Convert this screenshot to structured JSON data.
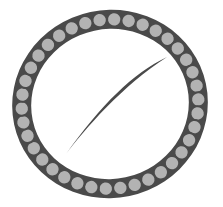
{
  "canvas": {
    "width": 223,
    "height": 207,
    "background": "#ffffff",
    "title": "Beaded Oval Emblem with Swash Stroke"
  },
  "colors": {
    "background": "#ffffff",
    "ring_dark": "#4a4a4a",
    "bead_fill": "#b3b3b3",
    "bead_outline": "#4a4a4a",
    "swash_fill": "#4a4a4a"
  },
  "ring": {
    "label": "beaded-oval-ring",
    "center_x": 110,
    "center_y": 104,
    "outer_rx": 98,
    "outer_ry": 94,
    "inner_rx": 79,
    "inner_ry": 75,
    "rotation_deg": -12,
    "band_thickness": 19,
    "bead_count": 38,
    "bead_radius": 7.2,
    "bead_ring_rx": 88.5,
    "bead_ring_ry": 84.5,
    "bead_outline_width": 2.0
  },
  "swash": {
    "label": "swash-stroke",
    "description": "stylized leaf flame stroke",
    "tip_top_x": 167,
    "tip_top_y": 57,
    "tip_bottom_x": 62,
    "tip_bottom_y": 156,
    "fill": "#4a4a4a"
  },
  "meta": {
    "element_name": "emblem-logo",
    "shape_kind": "oval-bead-ring",
    "center_glyph": "swash"
  }
}
